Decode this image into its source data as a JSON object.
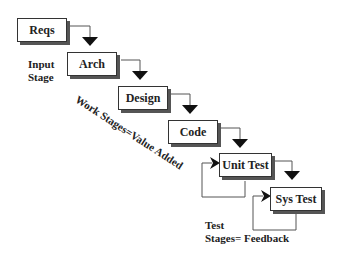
{
  "diagram": {
    "type": "waterfall-process",
    "stages": [
      {
        "id": "reqs",
        "label": "Reqs"
      },
      {
        "id": "arch",
        "label": "Arch"
      },
      {
        "id": "design",
        "label": "Design"
      },
      {
        "id": "code",
        "label": "Code"
      },
      {
        "id": "unit-test",
        "label": "Unit Test"
      },
      {
        "id": "sys-test",
        "label": "Sys Test"
      }
    ],
    "annotations": {
      "input_line1": "Input",
      "input_line2": "Stage",
      "work": "Work Stages=Value Added",
      "test_line1": "Test",
      "test_line2": "Stages= Feedback"
    },
    "colors": {
      "line": "#555555",
      "arrow": "#111111",
      "shadow": "#555555"
    }
  }
}
